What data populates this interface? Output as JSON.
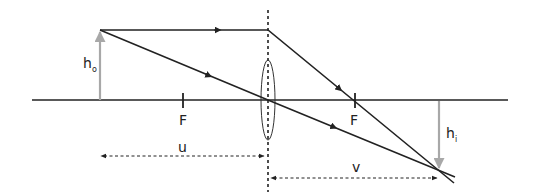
{
  "diagram": {
    "labels": {
      "object_height": "h",
      "object_height_sub": "o",
      "image_height": "h",
      "image_height_sub": "i",
      "focal_left": "F",
      "focal_right": "F",
      "object_distance": "u",
      "image_distance": "v"
    },
    "colors": {
      "line": "#222222",
      "arrow_gray": "#a8a8a8"
    }
  }
}
